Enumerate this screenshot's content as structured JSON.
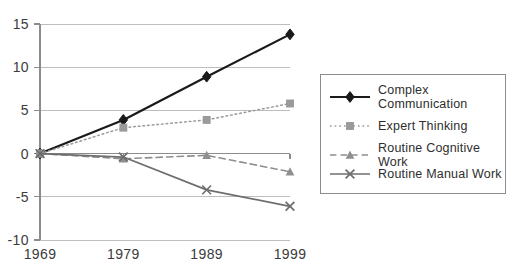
{
  "chart_data": {
    "type": "line",
    "title": "",
    "subtitle": "",
    "xlabel": "",
    "ylabel": "",
    "x": [
      1969,
      1979,
      1989,
      1999
    ],
    "categories": [
      "1969",
      "1979",
      "1989",
      "1999"
    ],
    "xtick_labels": [
      "1969",
      "1979",
      "1989",
      "1999"
    ],
    "ytick_labels": [
      "15",
      "10",
      "5",
      "0",
      "-5",
      "-10"
    ],
    "yticks": [
      15,
      10,
      5,
      0,
      -5,
      -10
    ],
    "ylim": [
      -10,
      15
    ],
    "xlim": [
      1969,
      1999
    ],
    "grid": true,
    "legend_position": "right",
    "series": [
      {
        "name": "Complex\nCommunication",
        "legend_label": "Complex\nCommunication",
        "values": [
          0,
          3.9,
          8.9,
          13.8
        ],
        "color": "#1a1a1a",
        "marker": "diamond",
        "line_style": "solid",
        "line_width": 2.2
      },
      {
        "name": "Expert Thinking",
        "legend_label": "Expert Thinking",
        "values": [
          0,
          3.0,
          3.9,
          5.8
        ],
        "color": "#9a9a9a",
        "marker": "square",
        "line_style": "dotted",
        "line_width": 1.5
      },
      {
        "name": "Routine Cognitive Work",
        "legend_label": "Routine Cognitive Work",
        "values": [
          0,
          -0.6,
          -0.2,
          -2.1
        ],
        "color": "#8f8f8f",
        "marker": "triangle",
        "line_style": "dashed",
        "line_width": 1.6
      },
      {
        "name": "Routine Manual Work",
        "legend_label": "Routine Manual Work",
        "values": [
          0,
          -0.4,
          -4.2,
          -6.1
        ],
        "color": "#6e6e6e",
        "marker": "x",
        "line_style": "solid",
        "line_width": 1.7
      }
    ]
  },
  "colors": {
    "background": "#ffffff",
    "grid": "#bdbdbd",
    "axis": "#8c8c8c",
    "tick_text": "#3b3b3b",
    "legend_border": "#8c8c8c",
    "legend_text": "#2e2e2e"
  }
}
